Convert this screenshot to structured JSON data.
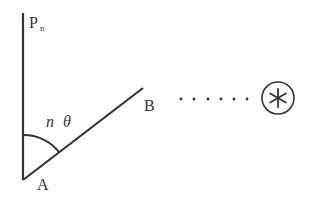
{
  "diagram": {
    "labels": {
      "P": "P",
      "P_sub": "n",
      "angle_n": "n",
      "angle_theta": "θ",
      "A": "A",
      "B": "B",
      "dots": "· · · · · ·",
      "star": "*"
    },
    "colors": {
      "stroke": "#333333",
      "background": "#ffffff"
    }
  }
}
